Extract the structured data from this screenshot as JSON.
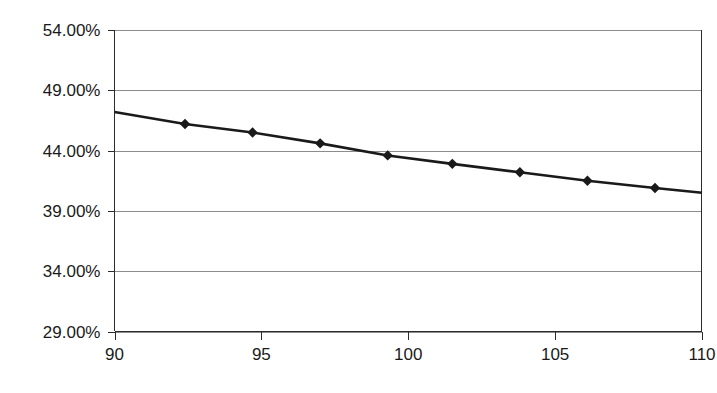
{
  "chart_data": {
    "type": "line",
    "title": "",
    "subtitle": "",
    "xlabel": "",
    "ylabel": "",
    "xlim": [
      90,
      110
    ],
    "ylim": [
      29,
      54
    ],
    "grid": true,
    "legend": false,
    "legend_position": "none",
    "y_tick_labels": [
      "54.00%",
      "49.00%",
      "44.00%",
      "39.00%",
      "34.00%",
      "29.00%"
    ],
    "y_tick_values": [
      54,
      49,
      44,
      39,
      34,
      29
    ],
    "x_tick_labels": [
      "90",
      "95",
      "100",
      "105",
      "110"
    ],
    "x_tick_values": [
      90,
      95,
      100,
      105,
      110
    ],
    "marker": "diamond",
    "series": [
      {
        "name": "series-1",
        "x": [
          90,
          92.4,
          94.7,
          97.0,
          99.3,
          101.5,
          103.8,
          106.1,
          108.4,
          110
        ],
        "values": [
          47.2,
          46.2,
          45.5,
          44.6,
          43.6,
          42.9,
          42.2,
          41.5,
          40.9,
          40.5
        ],
        "marker_at": [
          false,
          true,
          true,
          true,
          true,
          true,
          true,
          true,
          true,
          false
        ]
      }
    ]
  },
  "colors": {
    "line": "#1a1a1a",
    "marker": "#1a1a1a",
    "grid": "#8c8c8c",
    "axis": "#2b2b2b",
    "background": "#ffffff",
    "text": "#1a1a1a"
  }
}
